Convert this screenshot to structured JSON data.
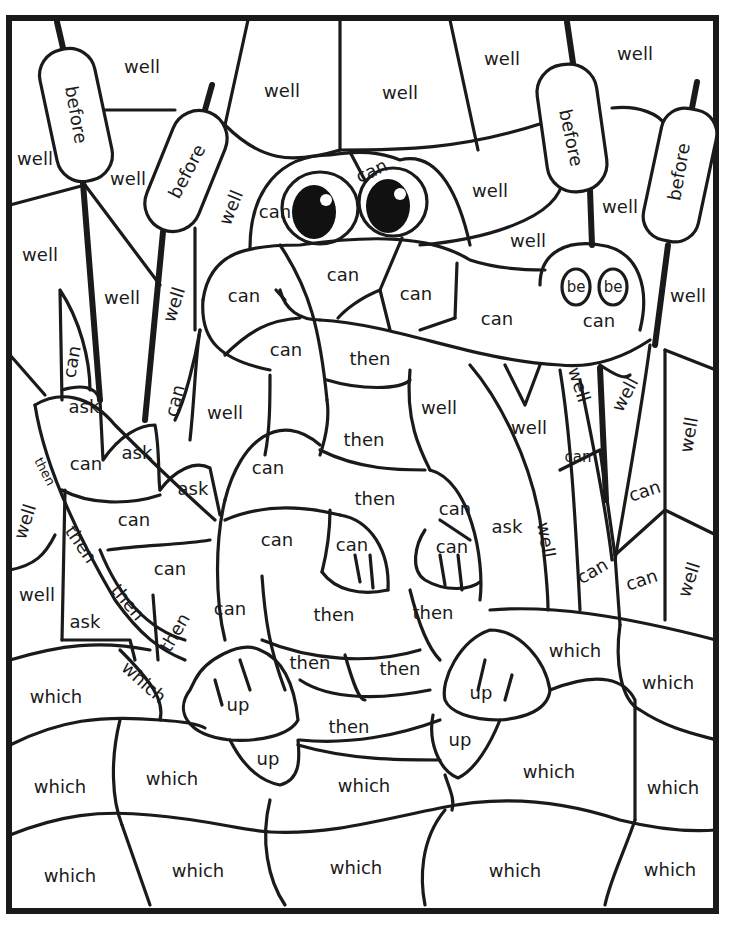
{
  "page": {
    "type": "color-by-sight-word worksheet"
  },
  "word_list": [
    "well",
    "before",
    "can",
    "be",
    "then",
    "ask",
    "up",
    "which"
  ],
  "labels": [
    {
      "word": "well",
      "x": 142,
      "y": 68,
      "rot": 0
    },
    {
      "word": "well",
      "x": 282,
      "y": 92,
      "rot": 0
    },
    {
      "word": "well",
      "x": 400,
      "y": 94,
      "rot": 0
    },
    {
      "word": "well",
      "x": 502,
      "y": 60,
      "rot": 0
    },
    {
      "word": "well",
      "x": 635,
      "y": 55,
      "rot": 0
    },
    {
      "word": "before",
      "x": 75,
      "y": 115,
      "rot": 80
    },
    {
      "word": "before",
      "x": 188,
      "y": 172,
      "rot": -62
    },
    {
      "word": "before",
      "x": 570,
      "y": 138,
      "rot": 78
    },
    {
      "word": "before",
      "x": 680,
      "y": 172,
      "rot": -80
    },
    {
      "word": "well",
      "x": 35,
      "y": 160,
      "rot": 0
    },
    {
      "word": "well",
      "x": 128,
      "y": 180,
      "rot": 0
    },
    {
      "word": "well",
      "x": 232,
      "y": 208,
      "rot": -68
    },
    {
      "word": "can",
      "x": 275,
      "y": 213,
      "rot": 0
    },
    {
      "word": "can",
      "x": 372,
      "y": 172,
      "rot": -25
    },
    {
      "word": "well",
      "x": 490,
      "y": 192,
      "rot": 0
    },
    {
      "word": "well",
      "x": 620,
      "y": 208,
      "rot": 0
    },
    {
      "word": "well",
      "x": 528,
      "y": 242,
      "rot": 0
    },
    {
      "word": "well",
      "x": 40,
      "y": 256,
      "rot": 0
    },
    {
      "word": "well",
      "x": 122,
      "y": 299,
      "rot": 0
    },
    {
      "word": "well",
      "x": 175,
      "y": 305,
      "rot": -72
    },
    {
      "word": "can",
      "x": 244,
      "y": 297,
      "rot": 0
    },
    {
      "word": "can",
      "x": 343,
      "y": 276,
      "rot": 0
    },
    {
      "word": "can",
      "x": 416,
      "y": 295,
      "rot": 0
    },
    {
      "word": "can",
      "x": 497,
      "y": 320,
      "rot": 0
    },
    {
      "word": "be",
      "x": 576,
      "y": 287,
      "rot": 0
    },
    {
      "word": "be",
      "x": 613,
      "y": 287,
      "rot": 0
    },
    {
      "word": "can",
      "x": 599,
      "y": 322,
      "rot": 0
    },
    {
      "word": "well",
      "x": 688,
      "y": 297,
      "rot": 0
    },
    {
      "word": "can",
      "x": 73,
      "y": 362,
      "rot": -80
    },
    {
      "word": "can",
      "x": 286,
      "y": 351,
      "rot": 0
    },
    {
      "word": "then",
      "x": 370,
      "y": 360,
      "rot": 0
    },
    {
      "word": "can",
      "x": 176,
      "y": 401,
      "rot": -75
    },
    {
      "word": "ask",
      "x": 84,
      "y": 408,
      "rot": 0
    },
    {
      "word": "well",
      "x": 225,
      "y": 414,
      "rot": 0
    },
    {
      "word": "well",
      "x": 439,
      "y": 409,
      "rot": 0
    },
    {
      "word": "well",
      "x": 578,
      "y": 385,
      "rot": 72
    },
    {
      "word": "well",
      "x": 626,
      "y": 395,
      "rot": -62
    },
    {
      "word": "well",
      "x": 529,
      "y": 429,
      "rot": 0
    },
    {
      "word": "well",
      "x": 690,
      "y": 435,
      "rot": -80
    },
    {
      "word": "then",
      "x": 44,
      "y": 472,
      "rot": 62
    },
    {
      "word": "can",
      "x": 86,
      "y": 465,
      "rot": 0
    },
    {
      "word": "ask",
      "x": 137,
      "y": 454,
      "rot": 0
    },
    {
      "word": "then",
      "x": 364,
      "y": 441,
      "rot": 0
    },
    {
      "word": "can",
      "x": 578,
      "y": 457,
      "rot": 0
    },
    {
      "word": "can",
      "x": 268,
      "y": 469,
      "rot": 0
    },
    {
      "word": "ask",
      "x": 193,
      "y": 490,
      "rot": 0
    },
    {
      "word": "then",
      "x": 375,
      "y": 500,
      "rot": 0
    },
    {
      "word": "can",
      "x": 455,
      "y": 510,
      "rot": 0
    },
    {
      "word": "can",
      "x": 645,
      "y": 492,
      "rot": -18
    },
    {
      "word": "well",
      "x": 26,
      "y": 522,
      "rot": -72
    },
    {
      "word": "can",
      "x": 134,
      "y": 521,
      "rot": 0
    },
    {
      "word": "then",
      "x": 80,
      "y": 545,
      "rot": 55
    },
    {
      "word": "can",
      "x": 277,
      "y": 541,
      "rot": 0
    },
    {
      "word": "can",
      "x": 352,
      "y": 546,
      "rot": 0
    },
    {
      "word": "can",
      "x": 452,
      "y": 548,
      "rot": 0
    },
    {
      "word": "ask",
      "x": 507,
      "y": 528,
      "rot": 0
    },
    {
      "word": "well",
      "x": 545,
      "y": 540,
      "rot": 80
    },
    {
      "word": "can",
      "x": 170,
      "y": 570,
      "rot": 0
    },
    {
      "word": "well",
      "x": 37,
      "y": 596,
      "rot": 0
    },
    {
      "word": "then",
      "x": 127,
      "y": 603,
      "rot": 50
    },
    {
      "word": "can",
      "x": 593,
      "y": 572,
      "rot": -30
    },
    {
      "word": "can",
      "x": 642,
      "y": 581,
      "rot": -18
    },
    {
      "word": "well",
      "x": 690,
      "y": 580,
      "rot": -72
    },
    {
      "word": "can",
      "x": 230,
      "y": 610,
      "rot": 0
    },
    {
      "word": "then",
      "x": 334,
      "y": 616,
      "rot": 0
    },
    {
      "word": "then",
      "x": 433,
      "y": 614,
      "rot": 0
    },
    {
      "word": "ask",
      "x": 85,
      "y": 623,
      "rot": 0
    },
    {
      "word": "then",
      "x": 176,
      "y": 633,
      "rot": -60
    },
    {
      "word": "which",
      "x": 575,
      "y": 652,
      "rot": 0
    },
    {
      "word": "which",
      "x": 143,
      "y": 683,
      "rot": 42
    },
    {
      "word": "then",
      "x": 310,
      "y": 664,
      "rot": 0
    },
    {
      "word": "then",
      "x": 400,
      "y": 670,
      "rot": 0
    },
    {
      "word": "which",
      "x": 668,
      "y": 684,
      "rot": 0
    },
    {
      "word": "which",
      "x": 56,
      "y": 698,
      "rot": 0
    },
    {
      "word": "up",
      "x": 238,
      "y": 706,
      "rot": 0
    },
    {
      "word": "up",
      "x": 481,
      "y": 694,
      "rot": 0
    },
    {
      "word": "then",
      "x": 349,
      "y": 728,
      "rot": 0
    },
    {
      "word": "up",
      "x": 268,
      "y": 760,
      "rot": 0
    },
    {
      "word": "up",
      "x": 460,
      "y": 741,
      "rot": 0
    },
    {
      "word": "which",
      "x": 549,
      "y": 773,
      "rot": 0
    },
    {
      "word": "which",
      "x": 172,
      "y": 780,
      "rot": 0
    },
    {
      "word": "which",
      "x": 60,
      "y": 788,
      "rot": 0
    },
    {
      "word": "which",
      "x": 364,
      "y": 787,
      "rot": 0
    },
    {
      "word": "which",
      "x": 673,
      "y": 789,
      "rot": 0
    },
    {
      "word": "which",
      "x": 70,
      "y": 877,
      "rot": 0
    },
    {
      "word": "which",
      "x": 198,
      "y": 872,
      "rot": 0
    },
    {
      "word": "which",
      "x": 356,
      "y": 869,
      "rot": 0
    },
    {
      "word": "which",
      "x": 515,
      "y": 872,
      "rot": 0
    },
    {
      "word": "which",
      "x": 670,
      "y": 871,
      "rot": 0
    }
  ]
}
